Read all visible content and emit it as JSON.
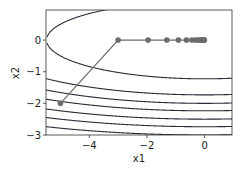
{
  "chart_data": {
    "type": "line",
    "title": "",
    "xlabel": "x1",
    "ylabel": "x2",
    "xlim": [
      -5.5,
      0.95
    ],
    "ylim": [
      -3,
      0.95
    ],
    "x_ticks": [
      -4,
      -2,
      0
    ],
    "y_ticks": [
      0,
      -1,
      -2,
      -3
    ],
    "x_tick_labels": [
      "−4",
      "−2",
      "0"
    ],
    "y_tick_labels": [
      "0",
      "−1",
      "−2",
      "−3"
    ],
    "grid": false,
    "legend": null,
    "contour_function": "f(x1,x2) = 0.1*x1^2 + 2*x2^2",
    "contour_levels": [
      3.0,
      6.0,
      8.0,
      10.0,
      12.5,
      15.0,
      18.0
    ],
    "series": [
      {
        "name": "gradient descent trajectory",
        "color": "#6b6b6b",
        "marker": "circle",
        "x": [
          -5.0,
          -3.0,
          -1.96,
          -1.31,
          -0.91,
          -0.63,
          -0.44,
          -0.31,
          -0.22,
          -0.15,
          -0.11,
          -0.07,
          -0.05,
          -0.04,
          -0.03,
          -0.02,
          -0.01
        ],
        "y": [
          -2.0,
          0.0,
          0.0,
          0.0,
          0.0,
          0.0,
          0.0,
          0.0,
          0.0,
          0.0,
          0.0,
          0.0,
          0.0,
          0.0,
          0.0,
          0.0,
          0.0
        ]
      }
    ]
  }
}
